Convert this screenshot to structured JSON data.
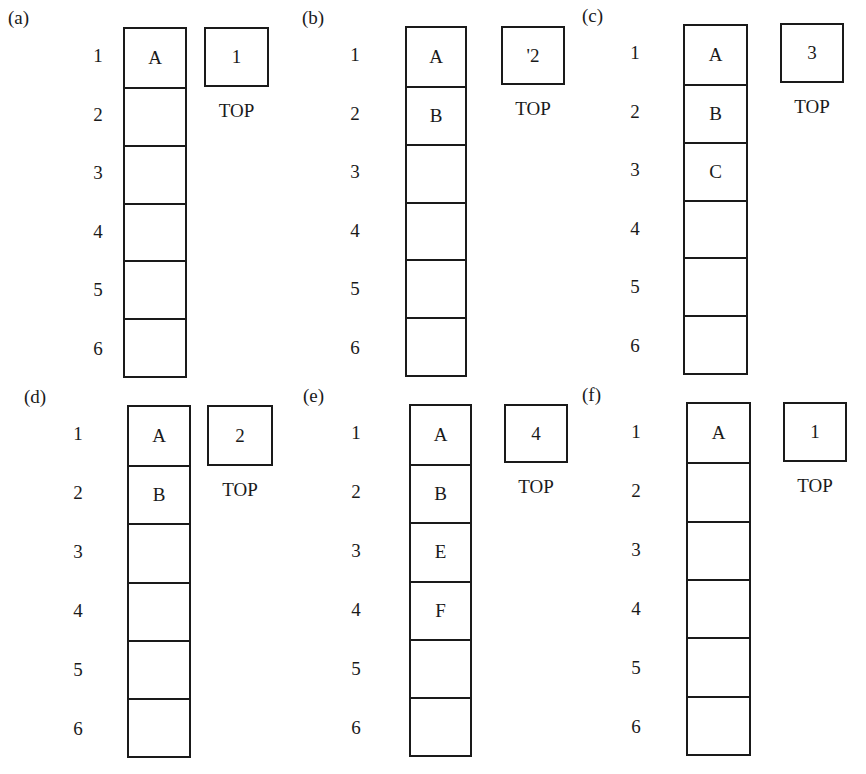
{
  "figure": {
    "top_pointer_label": "TOP",
    "row_indices": [
      "1",
      "2",
      "3",
      "4",
      "5",
      "6"
    ],
    "panels": [
      {
        "label": "(a)",
        "top_value": "1",
        "cells": [
          "A",
          "",
          "",
          "",
          "",
          ""
        ]
      },
      {
        "label": "(b)",
        "top_value": "'2",
        "cells": [
          "A",
          "B",
          "",
          "",
          "",
          ""
        ]
      },
      {
        "label": "(c)",
        "top_value": "3",
        "cells": [
          "A",
          "B",
          "C",
          "",
          "",
          ""
        ]
      },
      {
        "label": "(d)",
        "top_value": "2",
        "cells": [
          "A",
          "B",
          "",
          "",
          "",
          ""
        ]
      },
      {
        "label": "(e)",
        "top_value": "4",
        "cells": [
          "A",
          "B",
          "E",
          "F",
          "",
          ""
        ]
      },
      {
        "label": "(f)",
        "top_value": "1",
        "cells": [
          "A",
          "",
          "",
          "",
          "",
          ""
        ]
      }
    ]
  }
}
